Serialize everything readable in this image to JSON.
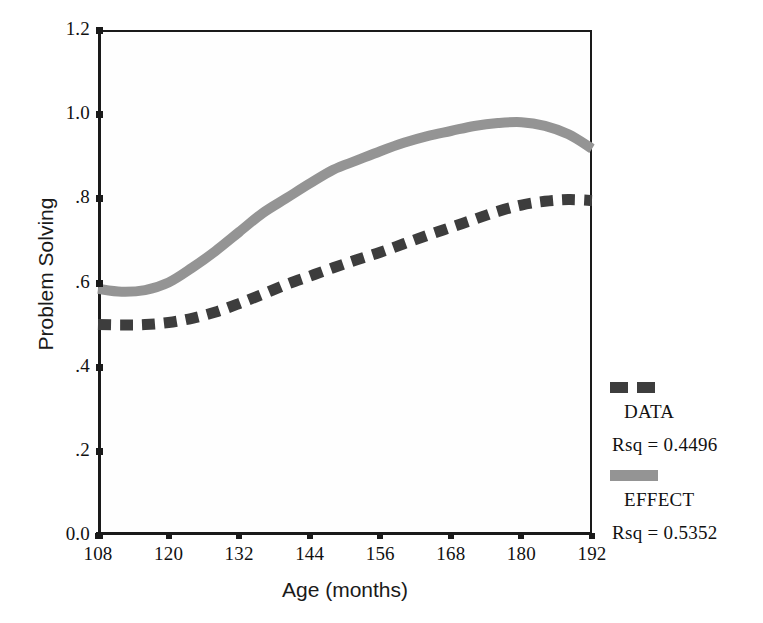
{
  "chart_data": {
    "type": "line",
    "title": "",
    "xlabel": "Age (months)",
    "ylabel": "Problem Solving",
    "xlim": [
      108,
      192
    ],
    "ylim": [
      0.0,
      1.2
    ],
    "xticks": [
      108,
      120,
      132,
      144,
      156,
      168,
      180,
      192
    ],
    "xtick_labels": [
      "108",
      "120",
      "132",
      "144",
      "156",
      "168",
      "180",
      "192"
    ],
    "yticks": [
      0.0,
      0.2,
      0.4,
      0.6,
      0.8,
      1.0,
      1.2
    ],
    "ytick_labels": [
      "0.0",
      ".2",
      ".4",
      ".6",
      ".8",
      "1.0",
      "1.2"
    ],
    "grid": false,
    "legend_position": "right",
    "x": [
      108,
      112,
      116,
      120,
      124,
      128,
      132,
      136,
      140,
      144,
      148,
      152,
      156,
      160,
      164,
      168,
      172,
      176,
      180,
      184,
      188,
      192
    ],
    "series": [
      {
        "name": "DATA",
        "style": "dashed",
        "color": "#3d3d3d",
        "rsq_label": "Rsq = 0.4496",
        "rsq": 0.4496,
        "values": [
          0.5,
          0.499,
          0.5,
          0.505,
          0.515,
          0.53,
          0.55,
          0.572,
          0.595,
          0.615,
          0.635,
          0.654,
          0.672,
          0.692,
          0.712,
          0.731,
          0.75,
          0.769,
          0.784,
          0.793,
          0.797,
          0.795
        ]
      },
      {
        "name": "EFFECT",
        "style": "solid",
        "color": "#949494",
        "rsq_label": "Rsq = 0.5352",
        "rsq": 0.5352,
        "values": [
          0.585,
          0.578,
          0.582,
          0.6,
          0.635,
          0.675,
          0.72,
          0.765,
          0.8,
          0.835,
          0.868,
          0.89,
          0.912,
          0.932,
          0.948,
          0.96,
          0.972,
          0.979,
          0.981,
          0.972,
          0.952,
          0.918
        ]
      }
    ]
  },
  "axes": {
    "xlabel": "Age (months)",
    "ylabel": "Problem Solving"
  },
  "legend": {
    "entries": [
      {
        "name": "DATA",
        "rsq_label": "Rsq = 0.4496"
      },
      {
        "name": "EFFECT",
        "rsq_label": "Rsq = 0.5352"
      }
    ]
  }
}
